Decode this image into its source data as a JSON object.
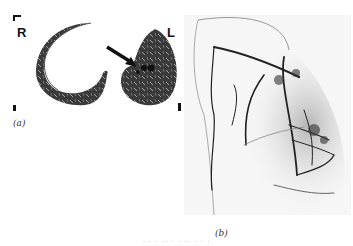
{
  "figure": {
    "panel_a": {
      "label": "(a)",
      "left_marker": "R",
      "right_marker": "L",
      "description": "Axial CT of lungs with arrow pointing to cystic lesion in left lung"
    },
    "panel_b": {
      "label": "(b)",
      "description": "Angiogram showing vascular network in left lung"
    },
    "caption": "· · · ·· ·  · ·· ·  · ·"
  }
}
